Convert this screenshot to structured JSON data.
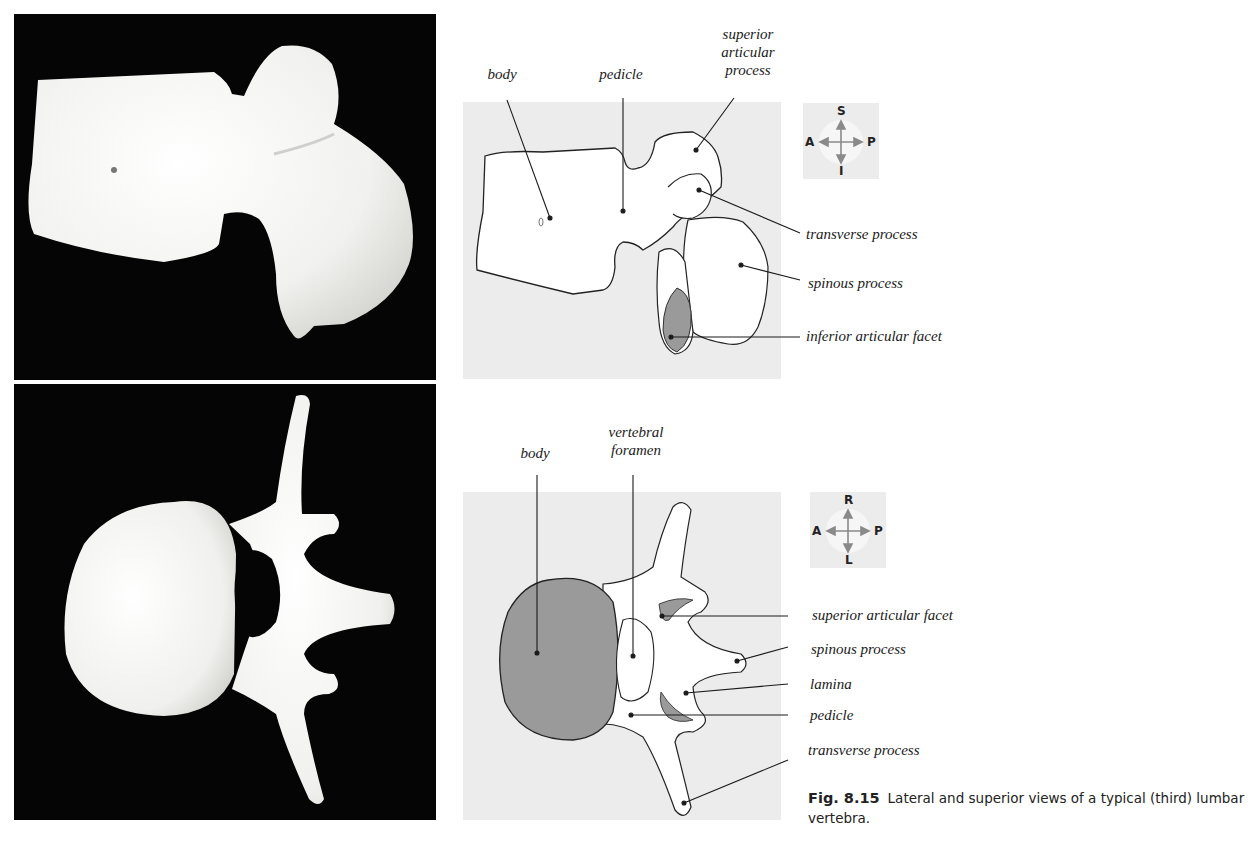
{
  "figure": {
    "number": "Fig. 8.15",
    "caption": "Lateral and superior views of a typical (third) lumbar vertebra."
  },
  "lateral_view": {
    "photo_alt": "lateral-view-photograph",
    "labels": {
      "body": "body",
      "pedicle": "pedicle",
      "superior_articular_process": [
        "superior",
        "articular",
        "process"
      ],
      "transverse_process": "transverse process",
      "spinous_process": "spinous process",
      "inferior_articular_facet": "inferior articular facet"
    },
    "compass": {
      "top": "S",
      "bottom": "I",
      "left": "A",
      "right": "P"
    }
  },
  "superior_view": {
    "photo_alt": "superior-view-photograph",
    "labels": {
      "body": "body",
      "vertebral_foramen": [
        "vertebral",
        "foramen"
      ],
      "superior_articular_facet": "superior articular facet",
      "spinous_process": "spinous process",
      "lamina": "lamina",
      "pedicle": "pedicle",
      "transverse_process": "transverse process"
    },
    "compass": {
      "top": "R",
      "bottom": "L",
      "left": "A",
      "right": "P"
    }
  },
  "colors": {
    "photo_bg": "#050505",
    "bone": "#f4f4f2",
    "panel_bg": "#ececec",
    "facet_shade": "#9a9a9a",
    "arrow": "#8a8a8a"
  }
}
